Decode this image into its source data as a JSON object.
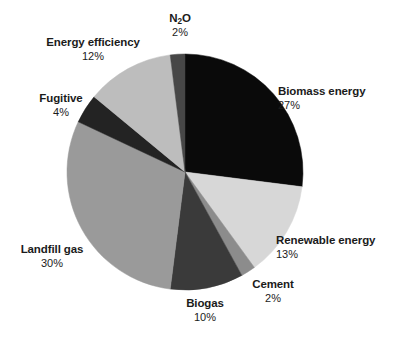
{
  "chart_data": {
    "type": "pie",
    "title": "",
    "xlabel": "",
    "ylabel": "",
    "legend_position": "none",
    "grid": false,
    "units": "percent",
    "start_angle_deg": 0,
    "direction": "clockwise",
    "categories": [
      "Biomass energy",
      "Renewable energy",
      "Cement",
      "Biogas",
      "Landfill gas",
      "Fugitive",
      "Energy efficiency",
      "N₂O"
    ],
    "values": [
      27,
      13,
      2,
      10,
      30,
      4,
      12,
      2
    ],
    "slices": [
      {
        "label": "Biomass energy",
        "value": 27,
        "pct_text": "27%",
        "color": "#0a0a0a"
      },
      {
        "label": "Renewable energy",
        "value": 13,
        "pct_text": "13%",
        "color": "#d7d7d7"
      },
      {
        "label": "Cement",
        "value": 2,
        "pct_text": "2%",
        "color": "#8c8c8c"
      },
      {
        "label": "Biogas",
        "value": 10,
        "pct_text": "10%",
        "color": "#3a3a3a"
      },
      {
        "label": "Landfill gas",
        "value": 30,
        "pct_text": "30%",
        "color": "#9a9a9a"
      },
      {
        "label": "Fugitive",
        "value": 4,
        "pct_text": "4%",
        "color": "#232323"
      },
      {
        "label": "Energy efficiency",
        "value": 12,
        "pct_text": "12%",
        "color": "#bdbdbd"
      },
      {
        "label": "N₂O",
        "value": 2,
        "pct_text": "2%",
        "color": "#474747"
      }
    ]
  },
  "labels": {
    "n2o": {
      "name_prefix": "N",
      "name_sub": "2",
      "name_suffix": "O",
      "pct": "2%"
    },
    "biomass": {
      "name": "Biomass energy",
      "pct": "27%"
    },
    "renewable": {
      "name": "Renewable energy",
      "pct": "13%"
    },
    "cement": {
      "name": "Cement",
      "pct": "2%"
    },
    "biogas": {
      "name": "Biogas",
      "pct": "10%"
    },
    "landfill": {
      "name": "Landfill gas",
      "pct": "30%"
    },
    "fugitive": {
      "name": "Fugitive",
      "pct": "4%"
    },
    "efficiency": {
      "name": "Energy efficiency",
      "pct": "12%"
    }
  },
  "geometry": {
    "center_x": 185,
    "center_y": 172,
    "radius": 118
  },
  "colors": {
    "background": "#ffffff",
    "text": "#1b1b1b"
  }
}
